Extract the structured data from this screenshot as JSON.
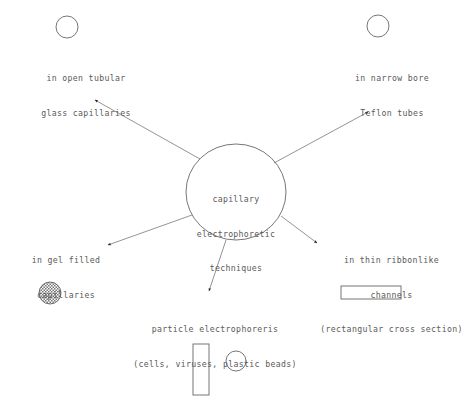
{
  "diagram": {
    "center": {
      "lines": [
        "capillary",
        "electrophoretic",
        "techniques"
      ]
    },
    "branches": [
      {
        "id": "open-tubular",
        "lines": [
          "in open tubular",
          "glass capillaries"
        ],
        "shape": "open-circle"
      },
      {
        "id": "narrow-bore",
        "lines": [
          "in narrow bore",
          "Teflon tubes"
        ],
        "shape": "open-circle"
      },
      {
        "id": "gel-filled",
        "lines": [
          "in gel filled",
          "capillaries"
        ],
        "shape": "hatched-circle"
      },
      {
        "id": "ribbonlike",
        "lines": [
          "in thin ribbonlike",
          "channels",
          "(rectangular cross section)"
        ],
        "shape": "horizontal-rectangle"
      },
      {
        "id": "particle-electrophoresis",
        "lines": [
          "particle electrophoreris",
          "(cells, viruses, plastic beads)"
        ],
        "shape": "vertical-rectangle-and-circle"
      }
    ],
    "caption": "",
    "colors": {
      "stroke": "#666666",
      "text": "#5a5a5a",
      "background": "#ffffff",
      "arrowhead": "#1a1a1a"
    }
  }
}
